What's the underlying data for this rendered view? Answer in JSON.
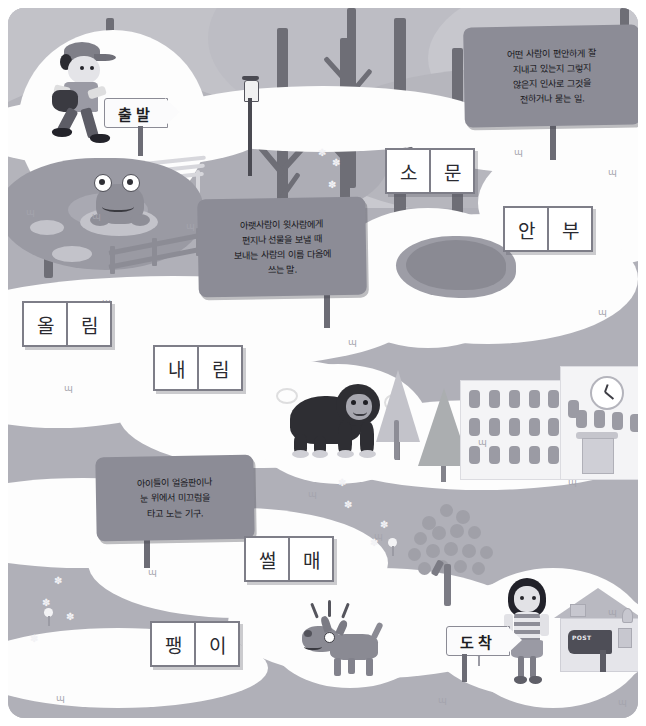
{
  "worksheet": {
    "title": "국어 어휘 길찾기 놀이판",
    "language": "ko"
  },
  "start_sign": {
    "label": "출발",
    "name": "start"
  },
  "finish_sign": {
    "label": "도착",
    "name": "finish"
  },
  "definition_signs": [
    {
      "id": "sign-greeting",
      "lines": [
        "어떤 사람이 편안하게 잘",
        "지내고 있는지 그렇지",
        "않은지 인사로 그것을",
        "전하거나 묻는 일."
      ]
    },
    {
      "id": "sign-ollim",
      "lines": [
        "아랫사람이 윗사람에게",
        "편지나 선물을 보낼 때",
        "보내는 사람의 이름 다음에",
        "쓰는 말."
      ]
    },
    {
      "id": "sign-sled",
      "lines": [
        "아이들이 얼음판이나",
        "눈 위에서 미끄럼을",
        "타고 노는 기구."
      ]
    }
  ],
  "word_boxes": [
    {
      "id": "word-somun",
      "syllables": [
        "소",
        "문"
      ]
    },
    {
      "id": "word-anbu",
      "syllables": [
        "안",
        "부"
      ]
    },
    {
      "id": "word-ollim",
      "syllables": [
        "올",
        "림"
      ]
    },
    {
      "id": "word-naerim",
      "syllables": [
        "내",
        "림"
      ]
    },
    {
      "id": "word-sseolmae",
      "syllables": [
        "썰",
        "매"
      ]
    },
    {
      "id": "word-paengi",
      "syllables": [
        "팽",
        "이"
      ]
    }
  ],
  "scene_labels": {
    "boy": "달리는 소년",
    "frog": "연못의 개구리",
    "bench": "공원 벤치",
    "lamp": "가로등",
    "cave": "굴",
    "gorilla": "고릴라",
    "school": "학교 건물",
    "dog": "짖는 개",
    "girl": "소녀",
    "house": "집과 우체통",
    "mailbox_text": "POST"
  },
  "colors": {
    "background": "#b9b9bf",
    "path": "#fdfdfd",
    "sign": "#8c8c96",
    "box_border": "#7e7e88",
    "ink": "#1d1d22"
  }
}
